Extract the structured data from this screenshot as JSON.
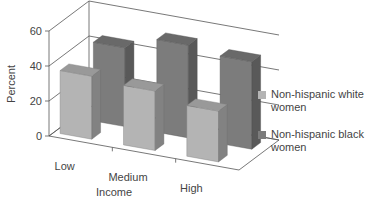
{
  "chart_data": {
    "type": "bar",
    "title": "",
    "xlabel": "Income",
    "ylabel": "Percent",
    "categories": [
      "Low",
      "Medium",
      "High"
    ],
    "ylim": [
      0,
      60
    ],
    "yticks": [
      0,
      20,
      40,
      60
    ],
    "grid": true,
    "legend_position": "right",
    "style": "3d-clustered-depth",
    "series": [
      {
        "name": "Non-hispanic white women",
        "values": [
          36,
          34,
          29
        ],
        "color": "#b4b4b4"
      },
      {
        "name": "Non-hispanic black women",
        "values": [
          45,
          53,
          50
        ],
        "color": "#7c7c7c"
      }
    ]
  },
  "legend": {
    "items": [
      {
        "label": "Non-hispanic white women",
        "color": "#b4b4b4"
      },
      {
        "label": "Non-hispanic black women",
        "color": "#7c7c7c"
      }
    ]
  }
}
